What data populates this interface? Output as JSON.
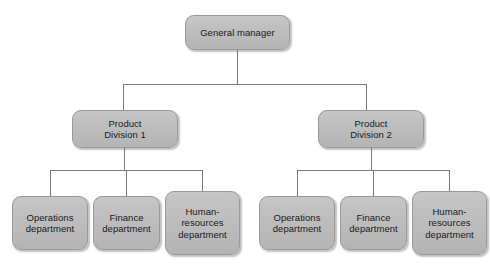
{
  "diagram": {
    "type": "organizational-chart",
    "background_color": "#ffffff",
    "node_fill_color": "#bdbdbd",
    "node_border_color": "#9a9a9a",
    "connector_color": "#7a7a7a",
    "text_color": "#1a1a1a"
  },
  "nodes": {
    "root": {
      "label": "General manager",
      "level": 0
    },
    "divisions": [
      {
        "label": "Product\nDivision 1",
        "level": 1
      },
      {
        "label": "Product\nDivision 2",
        "level": 1
      }
    ],
    "division_1_departments": [
      {
        "label": "Operations\ndepartment",
        "level": 2
      },
      {
        "label": "Finance\ndepartment",
        "level": 2
      },
      {
        "label": "Human-\nresources\ndepartment",
        "level": 2
      }
    ],
    "division_2_departments": [
      {
        "label": "Operations\ndepartment",
        "level": 2
      },
      {
        "label": "Finance\ndepartment",
        "level": 2
      },
      {
        "label": "Human-\nresources\ndepartment",
        "level": 2
      }
    ]
  }
}
